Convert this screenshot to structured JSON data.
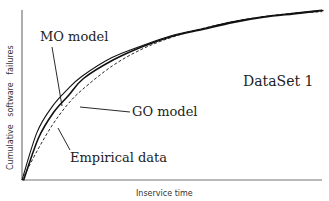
{
  "chart_data": {
    "type": "line",
    "title": "",
    "xlabel": "Inservice time",
    "ylabel": "Cumulative   software   failures",
    "annotation": "DataSet 1",
    "grid": false,
    "legend_position": "inline-callouts",
    "x": [
      0,
      0.05,
      0.1,
      0.15,
      0.2,
      0.3,
      0.4,
      0.5,
      0.6,
      0.7,
      0.8,
      0.9,
      1.0
    ],
    "series": [
      {
        "name": "MO model",
        "style": "solid",
        "values": [
          0,
          0.28,
          0.43,
          0.53,
          0.61,
          0.72,
          0.79,
          0.85,
          0.89,
          0.93,
          0.96,
          0.98,
          1.0
        ]
      },
      {
        "name": "GO model",
        "style": "dashed",
        "values": [
          0,
          0.17,
          0.32,
          0.44,
          0.53,
          0.67,
          0.77,
          0.84,
          0.89,
          0.93,
          0.96,
          0.98,
          0.99
        ]
      },
      {
        "name": "Empirical data",
        "style": "solid-jagged",
        "values": [
          0,
          0.25,
          0.4,
          0.5,
          0.6,
          0.71,
          0.79,
          0.85,
          0.89,
          0.93,
          0.96,
          0.98,
          1.0
        ]
      }
    ],
    "xlim": [
      0,
      1
    ],
    "ylim": [
      0,
      1
    ]
  },
  "labels": {
    "mo_model": "MO model",
    "go_model": "GO model",
    "empirical": "Empirical data",
    "dataset": "DataSet 1",
    "xlabel": "Inservice time",
    "ylabel": "Cumulative   software   failures"
  },
  "colors": {
    "axis": "#777777",
    "line": "#111111",
    "text": "#222222"
  }
}
